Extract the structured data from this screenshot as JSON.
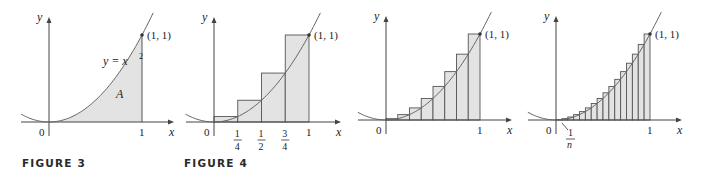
{
  "figures": [
    {
      "id": "figure-3",
      "caption": "FIGURE 3",
      "origin": [
        49,
        122
      ],
      "unit": [
        93,
        87
      ],
      "labels": {
        "y_axis": "y",
        "x_axis": "x",
        "origin": "0",
        "x_one": "1",
        "point": "(1, 1)",
        "curve": "y = x",
        "curve_exp": "2",
        "area": "A"
      },
      "mode": "area",
      "rectangles": 0
    },
    {
      "id": "figure-4",
      "caption": "FIGURE 4",
      "origin": [
        214,
        122
      ],
      "unit": [
        95,
        87
      ],
      "labels": {
        "y_axis": "y",
        "x_axis": "x",
        "origin": "0",
        "x_one": "1",
        "point": "(1, 1)",
        "ticks": [
          {
            "num": "1",
            "den": "4",
            "x": 0.25
          },
          {
            "num": "1",
            "den": "2",
            "x": 0.5
          },
          {
            "num": "3",
            "den": "4",
            "x": 0.75
          }
        ]
      },
      "mode": "right-endpoint-rectangles",
      "rectangles": 4
    },
    {
      "id": "figure-5a",
      "caption": "",
      "origin": [
        386,
        120
      ],
      "unit": [
        94,
        86
      ],
      "labels": {
        "y_axis": "y",
        "x_axis": "x",
        "origin": "0",
        "x_one": "1",
        "point": "(1, 1)"
      },
      "mode": "right-endpoint-rectangles",
      "rectangles": 8
    },
    {
      "id": "figure-5b",
      "caption": "",
      "origin": [
        556,
        120
      ],
      "unit": [
        94,
        86
      ],
      "labels": {
        "y_axis": "y",
        "x_axis": "x",
        "origin": "0",
        "x_one": "1",
        "point": "(1, 1)",
        "width_label_num": "1",
        "width_label_den": "n"
      },
      "mode": "right-endpoint-rectangles",
      "rectangles": 16
    }
  ],
  "colors": {
    "fill": "#e3e3e3",
    "stroke": "#555555",
    "curve": "#666666",
    "axis": "#444444",
    "caption": "#2a2a2a"
  },
  "chart_data": [
    {
      "type": "area",
      "title": "FIGURE 3",
      "function": "y = x^2",
      "x": [
        0,
        0.25,
        0.5,
        0.75,
        1
      ],
      "y": [
        0,
        0.0625,
        0.25,
        0.5625,
        1
      ],
      "shaded_region": {
        "from": 0,
        "to": 1,
        "label": "A"
      },
      "annotations": [
        "(1, 1)",
        "y = x^2",
        "A"
      ],
      "xlabel": "x",
      "ylabel": "y",
      "xticks": [
        "0",
        "1"
      ]
    },
    {
      "type": "bar",
      "title": "FIGURE 4",
      "function": "y = x^2",
      "rectangles": 4,
      "categories": [
        "[0, 1/4]",
        "[1/4, 1/2]",
        "[1/2, 3/4]",
        "[3/4, 1]"
      ],
      "values": [
        0.0625,
        0.25,
        0.5625,
        1
      ],
      "xlabel": "x",
      "ylabel": "y",
      "xticks": [
        "0",
        "1/4",
        "1/2",
        "3/4",
        "1"
      ],
      "annotations": [
        "(1, 1)"
      ]
    },
    {
      "type": "bar",
      "title": "",
      "function": "y = x^2",
      "rectangles": 8,
      "values": [
        0.015625,
        0.0625,
        0.140625,
        0.25,
        0.390625,
        0.5625,
        0.765625,
        1
      ],
      "xlabel": "x",
      "ylabel": "y",
      "xticks": [
        "0",
        "1"
      ],
      "annotations": [
        "(1, 1)"
      ]
    },
    {
      "type": "bar",
      "title": "",
      "function": "y = x^2",
      "rectangles": 16,
      "values": [
        0.0039,
        0.0156,
        0.0352,
        0.0625,
        0.0977,
        0.1406,
        0.1914,
        0.25,
        0.3164,
        0.3906,
        0.4727,
        0.5625,
        0.6602,
        0.7656,
        0.8789,
        1
      ],
      "xlabel": "x",
      "ylabel": "y",
      "xticks": [
        "0",
        "1"
      ],
      "annotations": [
        "(1, 1)",
        "1/n"
      ]
    }
  ]
}
